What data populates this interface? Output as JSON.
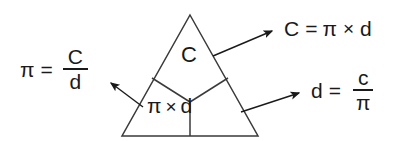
{
  "diagram": {
    "colors": {
      "background": "#ffffff",
      "ink": "#1a1a1a",
      "stroke": "#3a3a3a"
    },
    "triangle": {
      "apex": [
        190,
        15
      ],
      "base_left": [
        122,
        136
      ],
      "base_right": [
        258,
        136
      ],
      "top_cell_label": "C",
      "bottom_left_cell_label": "π",
      "bottom_operator": "×",
      "bottom_right_cell_label": "d"
    },
    "formulas": {
      "pi": {
        "lhs": "π",
        "equals": "=",
        "numerator": "C",
        "denominator": "d"
      },
      "circumference": {
        "lhs": "C",
        "equals": "=",
        "factor_one": "π",
        "operator": "×",
        "factor_two": "d"
      },
      "diameter": {
        "lhs": "d",
        "equals": "=",
        "numerator": "c",
        "denominator": "π"
      }
    },
    "arrows": [
      {
        "name": "arrow-to-pi-formula",
        "direction": "up-left"
      },
      {
        "name": "arrow-to-circumference-formula",
        "direction": "up-right"
      },
      {
        "name": "arrow-to-diameter-formula",
        "direction": "up-right"
      }
    ]
  }
}
